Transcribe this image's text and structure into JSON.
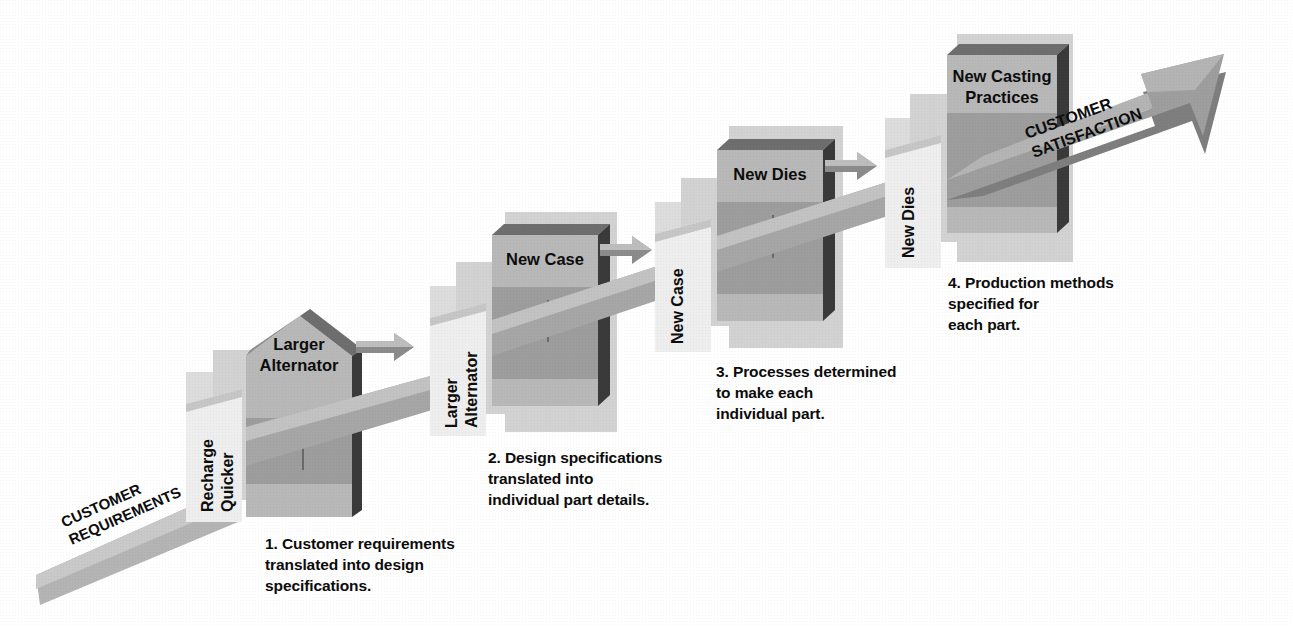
{
  "diagram": {
    "title_visible": false,
    "colors": {
      "background": "#ffffff",
      "band_light": "#bdbdbd",
      "body_mid": "#a2a2a2",
      "body_dark": "#8f8f8f",
      "side_dark": "#3a3a3a",
      "top_bevel": "#6e6e6e",
      "backdrop_light": "#d2d2d2",
      "backdrop_lighter": "#dcdcdc",
      "panel_white": "#f2f2f2",
      "ribbon": "#9a9a9a",
      "ribbon_light": "#c5c5c5",
      "arrow_gray": "#8b8b8b",
      "text": "#0d0d0d"
    }
  },
  "input_ribbon": {
    "label": "CUSTOMER\nREQUIREMENTS"
  },
  "output_arrow": {
    "label": "CUSTOMER\nSATISFACTION"
  },
  "stages": [
    {
      "id": 1,
      "number": "1.",
      "side_panel_label": "Recharge\nQuicker",
      "box_label": "Larger\nAlternator",
      "caption": "1. Customer requirements\n    translated into design\n    specifications.",
      "shape": "house"
    },
    {
      "id": 2,
      "number": "2.",
      "side_panel_label": "Larger\nAlternator",
      "box_label": "New Case",
      "caption": "2. Design specifications\n    translated into\n    individual part details.",
      "shape": "box"
    },
    {
      "id": 3,
      "number": "3.",
      "side_panel_label": "New Case",
      "box_label": "New Dies",
      "caption": "3. Processes determined\n    to make each\n    individual part.",
      "shape": "box"
    },
    {
      "id": 4,
      "number": "4.",
      "side_panel_label": "New Dies",
      "box_label": "New Casting\nPractices",
      "caption": "4. Production methods\n    specified for\n    each part.",
      "shape": "box"
    }
  ]
}
